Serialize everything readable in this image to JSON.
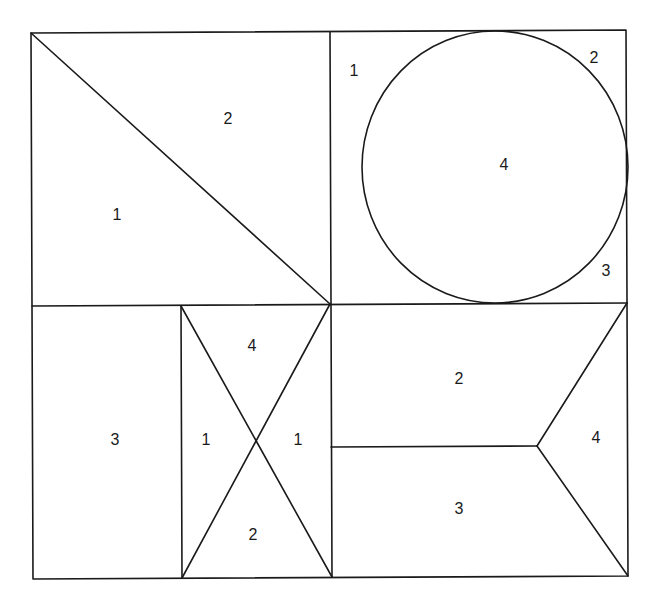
{
  "diagram": {
    "stroke_color": "#1a1a1a",
    "background": "#ffffff",
    "quadrants": {
      "top_left": {
        "description": "Square split by diagonal from top-left to bottom-right",
        "labels": [
          {
            "id": "tl-lower",
            "text": "1",
            "x": 117,
            "y": 214
          },
          {
            "id": "tl-upper",
            "text": "2",
            "x": 228,
            "y": 118
          }
        ]
      },
      "top_right": {
        "description": "Square with inscribed circle",
        "labels": [
          {
            "id": "tr-corner-tl",
            "text": "1",
            "x": 354,
            "y": 70
          },
          {
            "id": "tr-corner-tr",
            "text": "2",
            "x": 594,
            "y": 57
          },
          {
            "id": "tr-circle",
            "text": "4",
            "x": 504,
            "y": 164
          },
          {
            "id": "tr-corner-br",
            "text": "3",
            "x": 606,
            "y": 270
          }
        ]
      },
      "bottom_left": {
        "description": "Rectangle plus box with X diagonals",
        "labels": [
          {
            "id": "bl-rect",
            "text": "3",
            "x": 115,
            "y": 439
          },
          {
            "id": "bl-x-top",
            "text": "4",
            "x": 252,
            "y": 345
          },
          {
            "id": "bl-x-left",
            "text": "1",
            "x": 206,
            "y": 439
          },
          {
            "id": "bl-x-right",
            "text": "1",
            "x": 298,
            "y": 439
          },
          {
            "id": "bl-x-bottom",
            "text": "2",
            "x": 253,
            "y": 534
          }
        ]
      },
      "bottom_right": {
        "description": "Square split by horizontal line and a chevron into three regions",
        "labels": [
          {
            "id": "br-upper",
            "text": "2",
            "x": 459,
            "y": 378
          },
          {
            "id": "br-right",
            "text": "4",
            "x": 596,
            "y": 437
          },
          {
            "id": "br-lower",
            "text": "3",
            "x": 459,
            "y": 508
          }
        ]
      }
    }
  }
}
